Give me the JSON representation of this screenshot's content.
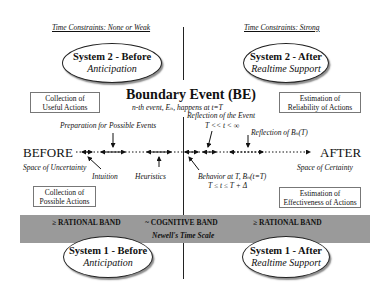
{
  "headers": {
    "left": "Time Constraints: None or Weak",
    "right": "Time Constraints: Strong"
  },
  "ellipses": {
    "system2_before": {
      "title": "System 2 - Before",
      "subtitle": "Anticipation"
    },
    "system2_after": {
      "title": "System 2 - After",
      "subtitle": "Realtime Support"
    },
    "system1_before": {
      "title": "System 1 - Before",
      "subtitle": "Anticipation"
    },
    "system1_after": {
      "title": "System 1 - After",
      "subtitle": "Realtime Support"
    }
  },
  "boundary_event": {
    "title": "Boundary Event (BE)",
    "subtitle": "n-th event, Eₙ, happens at t=T"
  },
  "boxes": {
    "top_left": {
      "line1": "Collection of",
      "line2": "Useful Actions"
    },
    "top_right": {
      "line1": "Estimation of",
      "line2": "Reliability of Actions"
    },
    "bottom_left": {
      "line1": "Collection of",
      "line2": "Possible Actions"
    },
    "bottom_right": {
      "line1": "Estimation of",
      "line2": "Effectiveness of Actions"
    }
  },
  "timeline": {
    "before_label": "BEFORE",
    "after_label": "AFTER",
    "space_uncertainty": "Space of Uncertainty",
    "space_certainty": "Space of Certainty",
    "preparation": "Preparation for Possible Events",
    "intuition": "Intuition",
    "heuristics": "Heuristics",
    "reflection_event": "Reflection of the Event",
    "reflection_event_range": "T << t < ∞",
    "reflection_bn": "Reflection of Bₙ(T)",
    "behavior_at_t": "Behavior at T,  Bₙ(t=T)",
    "behavior_range": "T ≤ t ≤ T + Δ"
  },
  "band": {
    "left": "≥ RATIONAL BAND",
    "center": "~ COGNITIVE BAND",
    "right": "≥ RATIONAL BAND",
    "caption": "Newell's Time Scale",
    "color": "#9a9a9a"
  }
}
